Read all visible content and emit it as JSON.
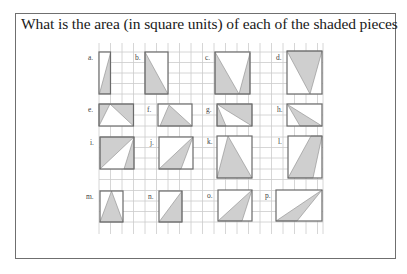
{
  "question": "What is the area (in square units) of each of the shaded pieces",
  "colors": {
    "shade": "#cfcfcf",
    "outline": "#6a6a6a",
    "grid": "#c9c9c9",
    "frame": "#6f6f6f"
  },
  "figures": [
    {
      "label": "a."
    },
    {
      "label": "b."
    },
    {
      "label": "c."
    },
    {
      "label": "d."
    },
    {
      "label": "e."
    },
    {
      "label": "f."
    },
    {
      "label": "g."
    },
    {
      "label": "h."
    },
    {
      "label": "i."
    },
    {
      "label": "j."
    },
    {
      "label": "k."
    },
    {
      "label": "l."
    },
    {
      "label": "m."
    },
    {
      "label": "n."
    },
    {
      "label": "o."
    },
    {
      "label": "p."
    }
  ]
}
